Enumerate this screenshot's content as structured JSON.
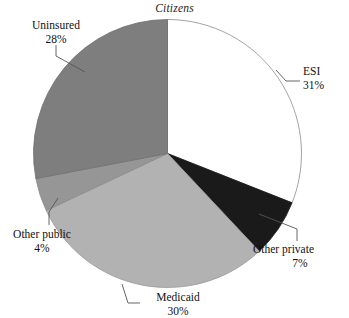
{
  "chart_data": {
    "type": "pie",
    "title": "Citizens",
    "xlabel": "",
    "ylabel": "",
    "legend_position": "none",
    "grid": false,
    "labels_show_percent": true,
    "start_angle_deg": 0,
    "direction": "clockwise",
    "categories": [
      "ESI",
      "Other private",
      "Medicaid",
      "Other public",
      "Uninsured"
    ],
    "values": [
      31,
      7,
      30,
      4,
      28
    ],
    "value_unit": "%",
    "slices": [
      {
        "name": "ESI",
        "value": 31,
        "value_label": "31%",
        "color": "#ffffff",
        "stroke": "#8c8c8c"
      },
      {
        "name": "Other private",
        "value": 7,
        "value_label": "7%",
        "color": "#1a1a1a",
        "stroke": "#1a1a1a"
      },
      {
        "name": "Medicaid",
        "value": 30,
        "value_label": "30%",
        "color": "#b2b2b2",
        "stroke": "#9a9a9a"
      },
      {
        "name": "Other public",
        "value": 4,
        "value_label": "4%",
        "color": "#969696",
        "stroke": "#8a8a8a"
      },
      {
        "name": "Uninsured",
        "value": 28,
        "value_label": "28%",
        "color": "#7e7e7e",
        "stroke": "#6f6f6f"
      }
    ]
  },
  "title": {
    "text": "Citizens"
  },
  "labels": {
    "esi": {
      "name": "ESI",
      "value": "31%"
    },
    "other_private": {
      "name": "Other private",
      "value": "7%"
    },
    "medicaid": {
      "name": "Medicaid",
      "value": "30%"
    },
    "other_public": {
      "name": "Other public",
      "value": "4%"
    },
    "uninsured": {
      "name": "Uninsured",
      "value": "28%"
    }
  },
  "colors": {
    "background": "#ffffff",
    "text": "#111111",
    "leader_line": "#555555",
    "slice_outline": "#8c8c8c"
  }
}
